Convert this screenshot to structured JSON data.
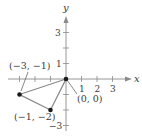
{
  "diagram": {
    "type": "coordinate-plane-triangle",
    "axes": {
      "x_label": "x",
      "y_label": "y",
      "x_ticks": [
        -3,
        -2,
        -1,
        1,
        2,
        3
      ],
      "y_ticks": [
        -3,
        -2,
        -1,
        1,
        2,
        3
      ],
      "x_tick_labels": [
        "1",
        "2",
        "3"
      ],
      "y_tick_labels": [
        "3",
        "1",
        "−3"
      ]
    },
    "points": [
      {
        "label": "(0, 0)",
        "x": 0,
        "y": 0
      },
      {
        "label": "(−3, −1)",
        "x": -3,
        "y": -1
      },
      {
        "label": "(−1, −2)",
        "x": -1,
        "y": -2
      }
    ],
    "colors": {
      "axis": "#7a7a7a",
      "triangle": "#8a8a8a",
      "point": "#1a1a1a",
      "text": "#3a3a3a"
    }
  }
}
